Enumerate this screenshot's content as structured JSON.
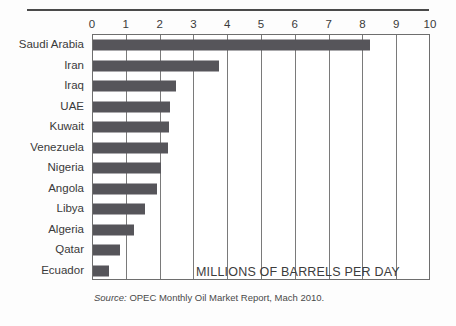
{
  "chart_data": {
    "type": "bar",
    "orientation": "horizontal",
    "title": "",
    "subtitle": "",
    "xlabel": "MILLIONS OF BARRELS PER DAY",
    "ylabel": "",
    "xlim": [
      0,
      10
    ],
    "xticks": [
      0,
      1,
      2,
      3,
      4,
      5,
      6,
      7,
      8,
      9,
      10
    ],
    "xtick_labels": [
      "0",
      "1",
      "2",
      "3",
      "4",
      "5",
      "6",
      "7",
      "8",
      "9",
      "10"
    ],
    "grid": true,
    "grid_axis": "x",
    "legend": false,
    "categories": [
      "Saudi Arabia",
      "Iran",
      "Iraq",
      "UAE",
      "Kuwait",
      "Venezuela",
      "Nigeria",
      "Angola",
      "Libya",
      "Algeria",
      "Qatar",
      "Ecuador"
    ],
    "values": [
      8.2,
      3.73,
      2.45,
      2.27,
      2.26,
      2.23,
      2.0,
      1.88,
      1.55,
      1.22,
      0.81,
      0.48
    ],
    "bar_color": "#56555a",
    "annotation": "MILLIONS OF BARRELS PER DAY",
    "source_prefix": "Source:",
    "source_text": " OPEC Monthly Oil Market Report, Mach 2010."
  },
  "colors": {
    "bar": "#56555a",
    "frame": "#6e6e6e",
    "grid": "#7a7a7a",
    "rule_top": "#4a4a4a",
    "rule_bottom": "#c6c6c6",
    "text": "#3a3a3a"
  }
}
